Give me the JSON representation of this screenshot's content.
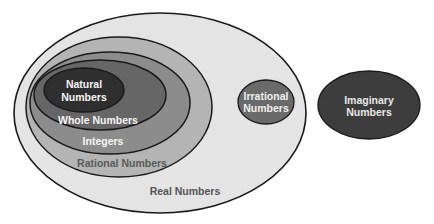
{
  "diagram": {
    "type": "nested-venn",
    "sets": {
      "real": {
        "label": "Real Numbers",
        "fill": "#e4e4e4",
        "text_color": "#555555"
      },
      "rational": {
        "label": "Rational Numbers",
        "fill": "#b4b4b4",
        "text_color": "#5a5a5a"
      },
      "integers": {
        "label": "Integers",
        "fill": "#8c8c8c",
        "text_color": "#f4f4f4"
      },
      "whole": {
        "label": "Whole Numbers",
        "fill": "#666666",
        "text_color": "#f4f4f4"
      },
      "natural": {
        "label_line1": "Natural",
        "label_line2": "Numbers",
        "fill": "#2f2f2f",
        "text_color": "#f4f4f4"
      },
      "irrational": {
        "label_line1": "Irrational",
        "label_line2": "Numbers",
        "fill": "#6a6a6a",
        "text_color": "#f0f0f0"
      },
      "imaginary": {
        "label_line1": "Imaginary",
        "label_line2": "Numbers",
        "fill": "#3d3d3d",
        "text_color": "#e8e8e8"
      }
    },
    "stroke_color": "#1a1a1a"
  }
}
